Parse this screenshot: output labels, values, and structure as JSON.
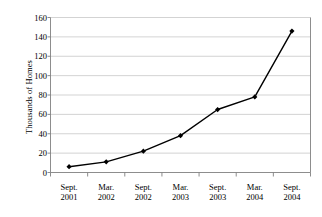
{
  "chart_data": {
    "type": "line",
    "title": "",
    "xlabel": "",
    "ylabel": "Thousands of Homes",
    "categories": [
      "Sept. 2001",
      "Mar. 2002",
      "Sept. 2002",
      "Mar. 2003",
      "Sept. 2003",
      "Mar. 2004",
      "Sept. 2004"
    ],
    "category_lines": [
      [
        "Sept.",
        "2001"
      ],
      [
        "Mar.",
        "2002"
      ],
      [
        "Sept.",
        "2002"
      ],
      [
        "Mar.",
        "2003"
      ],
      [
        "Sept.",
        "2003"
      ],
      [
        "Mar.",
        "2004"
      ],
      [
        "Sept.",
        "2004"
      ]
    ],
    "values": [
      6,
      11,
      22,
      38,
      65,
      78,
      146
    ],
    "ylim": [
      0,
      160
    ],
    "ytick_values": [
      0,
      20,
      40,
      60,
      80,
      100,
      120,
      140,
      160
    ],
    "ytick_labels": [
      "0",
      "20",
      "40",
      "60",
      "80",
      "100",
      "120",
      "140",
      "160"
    ],
    "grid": "horizontal",
    "legend": "none",
    "marker": "diamond",
    "series_color": "#000000",
    "grid_color": "#c8c8c8",
    "axis_color": "#808080",
    "background": "#ffffff"
  }
}
